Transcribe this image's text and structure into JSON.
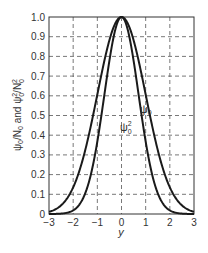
{
  "chart_data": {
    "type": "line",
    "title": "",
    "xlabel": "y",
    "ylabel": "ψ0/N0 and ψ0²/N0²",
    "xlim": [
      -3,
      3
    ],
    "ylim": [
      0,
      1.0
    ],
    "grid": true,
    "grid_style": "dashed",
    "x_ticks": [
      "−3",
      "−2",
      "−1",
      "0",
      "1",
      "2",
      "3"
    ],
    "y_ticks": [
      "0",
      "0.1",
      "0.2",
      "0.3",
      "0.4",
      "0.5",
      "0.6",
      "0.7",
      "0.8",
      "0.9",
      "1.0"
    ],
    "legend": "inline labels",
    "x": [
      -3,
      -2.5,
      -2,
      -1.5,
      -1,
      -0.5,
      0,
      0.5,
      1,
      1.5,
      2,
      2.5,
      3
    ],
    "series": [
      {
        "name": "ψ0",
        "label_text": "ψ0",
        "formula": "exp(-y^2/2)",
        "values": [
          0.011,
          0.044,
          0.135,
          0.325,
          0.607,
          0.882,
          1.0,
          0.882,
          0.607,
          0.325,
          0.135,
          0.044,
          0.011
        ]
      },
      {
        "name": "ψ0²",
        "label_text": "ψ0²",
        "formula": "exp(-y^2)",
        "values": [
          0.0001,
          0.002,
          0.018,
          0.105,
          0.368,
          0.779,
          1.0,
          0.779,
          0.368,
          0.105,
          0.018,
          0.002,
          0.0001
        ]
      }
    ],
    "colors": {
      "curve": "#1a1a1a",
      "grid": "#555555",
      "frame": "#333333",
      "text": "#333333"
    }
  }
}
